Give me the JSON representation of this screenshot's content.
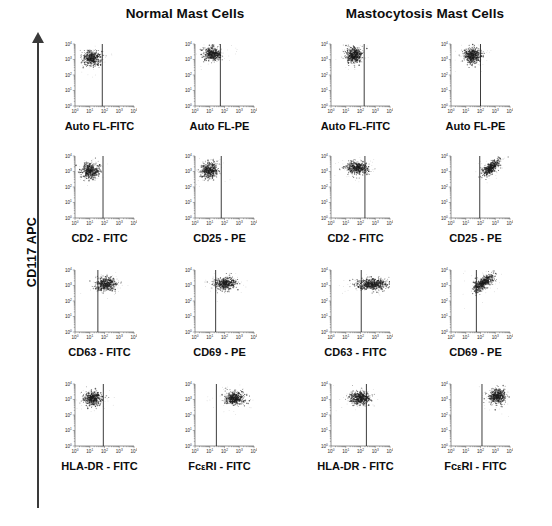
{
  "figure": {
    "width": 552,
    "height": 526,
    "background": "#ffffff",
    "ink_color": "#111111"
  },
  "yaxis": {
    "label": "CD117 APC",
    "arrow_direction": "up",
    "icon": "up-arrow-icon"
  },
  "groups": [
    {
      "id": "normal",
      "title": "Normal Mast Cells"
    },
    {
      "id": "mastocytosis",
      "title": "Mastocytosis Mast Cells"
    }
  ],
  "axis": {
    "tick_labels": [
      "10",
      "10",
      "10",
      "10",
      "10"
    ],
    "tick_exponents": [
      "0",
      "1",
      "2",
      "3",
      "4"
    ],
    "scale": "log",
    "decades": 4,
    "ylabel_shared": "CD117 APC"
  },
  "chart_data": {
    "type": "scatter",
    "ylabel": "CD117 APC",
    "xlabel": "marker fluorescence",
    "axis_type": "log-log",
    "xlim": [
      1,
      10000
    ],
    "ylim": [
      1,
      10000
    ],
    "xtick_labels": [
      "10^0",
      "10^1",
      "10^2",
      "10^3",
      "10^4"
    ],
    "ytick_labels": [
      "10^0",
      "10^1",
      "10^2",
      "10^3",
      "10^4"
    ],
    "grid": false,
    "legend": "none",
    "columns": [
      "Normal Mast Cells",
      "Mastocytosis Mast Cells"
    ],
    "rows": [
      "row1",
      "row2",
      "row3",
      "row4"
    ],
    "panels": [
      {
        "group": "Normal Mast Cells",
        "row": 1,
        "col": 1,
        "xlabel": "Auto FL-FITC",
        "gate_x_decade": 1.85,
        "cluster": {
          "cx_decade": 1.15,
          "cy_decade": 3.08,
          "sx": 0.3,
          "sy": 0.25,
          "n": 420,
          "shape": "round"
        },
        "interpretation": "CD117-bright, FITC-negative (left of gate)"
      },
      {
        "group": "Normal Mast Cells",
        "row": 1,
        "col": 2,
        "xlabel": "Auto FL-PE",
        "gate_x_decade": 1.72,
        "cluster": {
          "cx_decade": 1.2,
          "cy_decade": 3.35,
          "sx": 0.3,
          "sy": 0.22,
          "n": 420,
          "shape": "round"
        },
        "interpretation": "CD117-bright, PE-negative (left of gate)"
      },
      {
        "group": "Normal Mast Cells",
        "row": 2,
        "col": 1,
        "xlabel": "CD2 - FITC",
        "gate_x_decade": 1.9,
        "cluster": {
          "cx_decade": 1.05,
          "cy_decade": 3.05,
          "sx": 0.3,
          "sy": 0.25,
          "n": 420,
          "shape": "round"
        },
        "interpretation": "CD2 negative"
      },
      {
        "group": "Normal Mast Cells",
        "row": 2,
        "col": 2,
        "xlabel": "CD25 - PE",
        "gate_x_decade": 1.78,
        "cluster": {
          "cx_decade": 1.0,
          "cy_decade": 3.08,
          "sx": 0.28,
          "sy": 0.24,
          "n": 420,
          "shape": "round"
        },
        "interpretation": "CD25 negative"
      },
      {
        "group": "Normal Mast Cells",
        "row": 3,
        "col": 1,
        "xlabel": "CD63 - FITC",
        "gate_x_decade": 1.55,
        "cluster": {
          "cx_decade": 2.1,
          "cy_decade": 3.1,
          "sx": 0.35,
          "sy": 0.22,
          "n": 430,
          "shape": "round"
        },
        "interpretation": "CD63 positive (right of gate)"
      },
      {
        "group": "Normal Mast Cells",
        "row": 3,
        "col": 2,
        "xlabel": "CD69 - PE",
        "gate_x_decade": 1.4,
        "cluster": {
          "cx_decade": 2.05,
          "cy_decade": 3.12,
          "sx": 0.38,
          "sy": 0.2,
          "n": 430,
          "shape": "round"
        },
        "interpretation": "CD69 positive (right of gate)"
      },
      {
        "group": "Normal Mast Cells",
        "row": 4,
        "col": 1,
        "xlabel": "HLA-DR - FITC",
        "gate_x_decade": 1.92,
        "cluster": {
          "cx_decade": 1.2,
          "cy_decade": 3.05,
          "sx": 0.3,
          "sy": 0.22,
          "n": 420,
          "shape": "round"
        },
        "interpretation": "HLA-DR negative"
      },
      {
        "group": "Normal Mast Cells",
        "row": 4,
        "col": 2,
        "xlabel": "FcεRI - FITC",
        "gate_x_decade": 1.45,
        "cluster": {
          "cx_decade": 2.7,
          "cy_decade": 3.08,
          "sx": 0.33,
          "sy": 0.22,
          "n": 440,
          "shape": "round"
        },
        "interpretation": "FcεRI positive (right of gate)"
      },
      {
        "group": "Mastocytosis Mast Cells",
        "row": 1,
        "col": 1,
        "xlabel": "Auto FL-FITC",
        "gate_x_decade": 2.25,
        "cluster": {
          "cx_decade": 1.55,
          "cy_decade": 3.3,
          "sx": 0.28,
          "sy": 0.25,
          "n": 460,
          "shape": "round"
        },
        "interpretation": "CD117-bright, autofluorescence low"
      },
      {
        "group": "Mastocytosis Mast Cells",
        "row": 1,
        "col": 2,
        "xlabel": "Auto FL-PE",
        "gate_x_decade": 2.0,
        "cluster": {
          "cx_decade": 1.45,
          "cy_decade": 3.25,
          "sx": 0.28,
          "sy": 0.25,
          "n": 460,
          "shape": "round"
        },
        "interpretation": "CD117-bright, autofluorescence low"
      },
      {
        "group": "Mastocytosis Mast Cells",
        "row": 2,
        "col": 1,
        "xlabel": "CD2 - FITC",
        "gate_x_decade": 2.3,
        "cluster": {
          "cx_decade": 1.8,
          "cy_decade": 3.22,
          "sx": 0.38,
          "sy": 0.2,
          "n": 440,
          "shape": "wide"
        },
        "interpretation": "CD2 partially positive / shifted"
      },
      {
        "group": "Mastocytosis Mast Cells",
        "row": 2,
        "col": 2,
        "xlabel": "CD25 - PE",
        "gate_x_decade": 1.95,
        "cluster": {
          "cx_decade": 2.7,
          "cy_decade": 3.22,
          "sx": 0.3,
          "sy": 0.25,
          "n": 400,
          "shape": "diagonal"
        },
        "interpretation": "CD25 positive, diagonal CD117/CD25 correlation"
      },
      {
        "group": "Mastocytosis Mast Cells",
        "row": 3,
        "col": 1,
        "xlabel": "CD63 - FITC",
        "gate_x_decade": 2.05,
        "cluster": {
          "cx_decade": 2.8,
          "cy_decade": 3.08,
          "sx": 0.52,
          "sy": 0.18,
          "n": 520,
          "shape": "wide"
        },
        "interpretation": "CD63 strongly positive, broad spread"
      },
      {
        "group": "Mastocytosis Mast Cells",
        "row": 3,
        "col": 2,
        "xlabel": "CD69 - PE",
        "gate_x_decade": 1.72,
        "cluster": {
          "cx_decade": 2.2,
          "cy_decade": 3.18,
          "sx": 0.35,
          "sy": 0.28,
          "n": 470,
          "shape": "diagonal"
        },
        "interpretation": "CD69 positive"
      },
      {
        "group": "Mastocytosis Mast Cells",
        "row": 4,
        "col": 1,
        "xlabel": "HLA-DR - FITC",
        "gate_x_decade": 2.4,
        "cluster": {
          "cx_decade": 1.95,
          "cy_decade": 3.1,
          "sx": 0.33,
          "sy": 0.2,
          "n": 440,
          "shape": "wide"
        },
        "interpretation": "HLA-DR low/negative"
      },
      {
        "group": "Mastocytosis Mast Cells",
        "row": 4,
        "col": 2,
        "xlabel": "FcεRI - FITC",
        "gate_x_decade": 2.1,
        "cluster": {
          "cx_decade": 3.15,
          "cy_decade": 3.2,
          "sx": 0.28,
          "sy": 0.25,
          "n": 470,
          "shape": "round"
        },
        "interpretation": "FcεRI strongly positive"
      }
    ]
  }
}
